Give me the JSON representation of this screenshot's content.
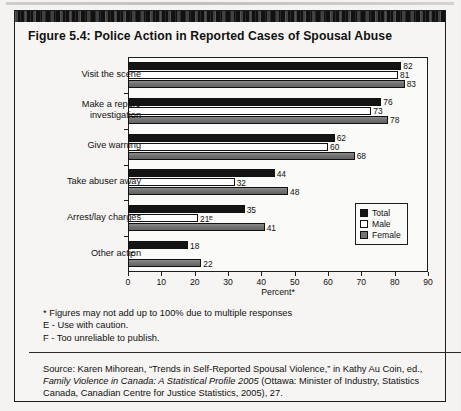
{
  "figure": {
    "title": "Figure 5.4: Police Action in Reported Cases of Spousal Abuse",
    "notes": [
      "* Figures may not add up to 100% due to multiple responses",
      "E - Use with caution.",
      "F - Too unreliable to publish."
    ],
    "source_prefix": "Source: Karen Mihorean, “Trends in Self-Reported Spousal Violence,” in Kathy Au Coin, ed., ",
    "source_italic": "Family Violence in Canada: A Statistical Profile 2005",
    "source_suffix": " (Ottawa: Minister of Industry, Statistics Canada, Canadian Centre for Justice Statistics, 2005), 27."
  },
  "chart_data": {
    "type": "bar",
    "orientation": "horizontal",
    "title": "Figure 5.4: Police Action in Reported Cases of Spousal Abuse",
    "xlabel": "Percent*",
    "ylabel": "",
    "xlim": [
      0,
      90
    ],
    "xticks": [
      0,
      10,
      20,
      30,
      40,
      50,
      60,
      70,
      80,
      90
    ],
    "xtick_labels": [
      "0",
      "10",
      "20",
      "30",
      "40",
      "50",
      "60",
      "70",
      "80",
      "90"
    ],
    "grid": false,
    "legend_position": "inside-right",
    "categories": [
      "Visit the scene",
      "Make a report/\ninvestigation",
      "Give warning",
      "Take abuser away",
      "Arrest/lay charges",
      "Other action"
    ],
    "series": [
      {
        "name": "Total",
        "color": "#141414",
        "values": [
          82,
          76,
          62,
          44,
          35,
          18
        ],
        "labels": [
          "82",
          "76",
          "62",
          "44",
          "35",
          "18"
        ]
      },
      {
        "name": "Male",
        "color": "#ffffff",
        "values": [
          81,
          73,
          60,
          32,
          21,
          null
        ],
        "labels": [
          "81",
          "73",
          "60",
          "32",
          "21ᴱ",
          "F"
        ]
      },
      {
        "name": "Female",
        "color": "#757575",
        "values": [
          83,
          78,
          68,
          48,
          41,
          22
        ],
        "labels": [
          "83",
          "78",
          "68",
          "48",
          "41",
          "22"
        ]
      }
    ],
    "annotations": [
      "E on Male Arrest/lay charges value (21) means use with caution",
      "F on Male Other action means too unreliable to publish"
    ]
  },
  "legend": {
    "items": [
      {
        "label": "Total",
        "swatch": "total"
      },
      {
        "label": "Male",
        "swatch": "male"
      },
      {
        "label": "Female",
        "swatch": "female"
      }
    ]
  }
}
